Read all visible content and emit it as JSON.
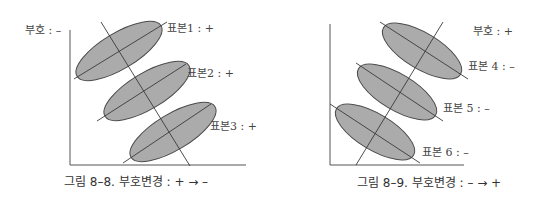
{
  "figures": [
    {
      "id": "fig-8-8",
      "caption": "그림 8–8. 부호변경 : + → –",
      "sign_label": "부호 : –",
      "samples": [
        {
          "label": "표본1 : +"
        },
        {
          "label": "표본2 : +"
        },
        {
          "label": "표본3 : +"
        }
      ]
    },
    {
      "id": "fig-8-9",
      "caption": "그림 8–9. 부호변경 : – → +",
      "sign_label": "부호 : +",
      "samples": [
        {
          "label": "표본 4 : –"
        },
        {
          "label": "표본 5 : –"
        },
        {
          "label": "표본 6 : –"
        }
      ]
    }
  ],
  "colors": {
    "ellipse_fill": "#ababab",
    "ellipse_stroke": "#4a4a4a",
    "line": "#3a3a3a",
    "axis": "#555555"
  }
}
